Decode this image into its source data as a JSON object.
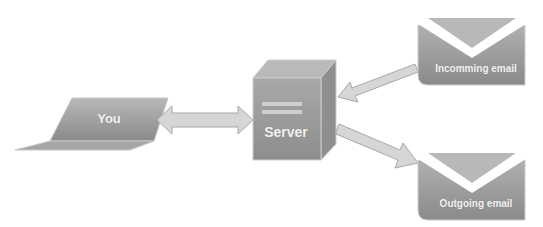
{
  "diagram": {
    "nodes": [
      {
        "id": "you",
        "label": "You",
        "shape": "laptop"
      },
      {
        "id": "server",
        "label": "Server",
        "shape": "server-cube"
      },
      {
        "id": "incoming",
        "label": "Incomming email",
        "shape": "envelope"
      },
      {
        "id": "outgoing",
        "label": "Outgoing email",
        "shape": "envelope"
      }
    ],
    "edges": [
      {
        "from": "you",
        "to": "server",
        "direction": "bidirectional"
      },
      {
        "from": "incoming",
        "to": "server",
        "direction": "forward"
      },
      {
        "from": "server",
        "to": "outgoing",
        "direction": "forward"
      }
    ]
  },
  "colors": {
    "node_fill_light": "#b4b4b4",
    "node_fill_dark": "#8c8c8c",
    "arrow_fill": "#d6d6d6",
    "arrow_stroke": "#a8a8a8",
    "text": "#f2f2f2"
  }
}
